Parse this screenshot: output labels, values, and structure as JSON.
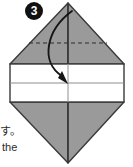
{
  "figure": {
    "step_number": "3",
    "kind": "origami-fold-diagram",
    "colors": {
      "paper_shadow": "#9a9a9a",
      "paper_front": "#ffffff",
      "outline": "#3a3a3a",
      "fold_line": "#555555",
      "arrow": "#1a1a1a",
      "background": "#ffffff"
    }
  },
  "caption": {
    "japanese_text": "す。",
    "english_text": "the"
  },
  "geometry": {
    "top_vertex": [
      68,
      3
    ],
    "bottom_vertex": [
      68,
      163
    ],
    "left_edge_x": 10,
    "right_edge_x": 124,
    "band_top_y": 64,
    "band_bottom_y": 102,
    "band_center_y": 83,
    "dashed_fold_y": 43,
    "center_x": 68,
    "arrow_start": [
      72,
      12
    ],
    "arrow_end": [
      68,
      83
    ]
  }
}
